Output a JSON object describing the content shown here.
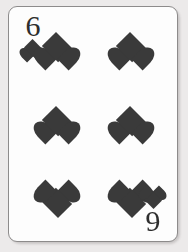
{
  "card": {
    "name": "six-of-hearts",
    "rank": "6",
    "rank_rotated": "9",
    "suit": "hearts",
    "suit_symbol": "♥",
    "suit_color_name": "black-print",
    "pip_count": 6,
    "face_color": "#fdfdfd",
    "border_color": "#8d8b8b",
    "pip_color": "#3a3a3a",
    "rank_color": "#2e2e2e",
    "background_color": "#eceaea",
    "corners": [
      {
        "position": "top-left",
        "rank_label": "6",
        "pip_orientation": "upright"
      },
      {
        "position": "bottom-right",
        "rank_label": "9",
        "pip_orientation": "inverted"
      }
    ],
    "pip_layout": {
      "columns": 2,
      "rows": 3,
      "rows_detail": [
        {
          "row": 1,
          "orientation": "upright",
          "count": 2
        },
        {
          "row": 2,
          "orientation": "upright",
          "count": 2
        },
        {
          "row": 3,
          "orientation": "inverted",
          "count": 2
        }
      ]
    }
  }
}
